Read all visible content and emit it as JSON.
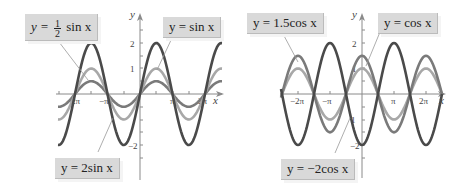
{
  "chart_data": [
    {
      "type": "line",
      "title": "",
      "xlabel": "x",
      "ylabel": "y",
      "x_ticks": [
        "-2π",
        "-π",
        "π",
        "2π"
      ],
      "y_ticks": [
        "-2",
        "1",
        "2"
      ],
      "xlim": [
        "-2.4π",
        "2.5π"
      ],
      "ylim": [
        -2.8,
        2.8
      ],
      "grid": false,
      "series": [
        {
          "name": "y = 2 sin x",
          "label": "y = 2sin x",
          "amplitude": 2,
          "func": "sin",
          "color": "#4a4a4a"
        },
        {
          "name": "y = sin x",
          "label": "y = sin x",
          "amplitude": 1,
          "func": "sin",
          "color": "#a8a8a8"
        },
        {
          "name": "y = (1/2) sin x",
          "label": "y = ½ sin x",
          "amplitude": 0.5,
          "func": "sin",
          "color": "#7a7a7a"
        }
      ],
      "annotations": [
        {
          "text_prefix": "y = ",
          "frac_num": "1",
          "frac_den": "2",
          "text_suffix": " sin x",
          "points_to": "y = (1/2) sin x"
        },
        {
          "text": "y = sin x",
          "points_to": "y = sin x"
        },
        {
          "text": "y = 2sin x",
          "points_to": "y = 2 sin x"
        }
      ]
    },
    {
      "type": "line",
      "title": "",
      "xlabel": "x",
      "ylabel": "y",
      "x_ticks": [
        "-2π",
        "-π",
        "π",
        "2π"
      ],
      "y_ticks": [
        "-2",
        "1",
        "2"
      ],
      "xlim": [
        "-2.5π",
        "2.8π"
      ],
      "ylim": [
        -2.8,
        2.8
      ],
      "grid": false,
      "series": [
        {
          "name": "y = -2 cos x",
          "label": "y = -2cos x",
          "amplitude": -2,
          "func": "cos",
          "color": "#4a4a4a"
        },
        {
          "name": "y = 1.5 cos x",
          "label": "y = 1.5cos x",
          "amplitude": 1.5,
          "func": "cos",
          "color": "#7a7a7a"
        },
        {
          "name": "y = cos x",
          "label": "y = cos x",
          "amplitude": 1,
          "func": "cos",
          "color": "#a8a8a8"
        }
      ],
      "annotations": [
        {
          "text": "y = 1.5cos x",
          "points_to": "y = 1.5 cos x"
        },
        {
          "text": "y = cos x",
          "points_to": "y = cos x"
        },
        {
          "text": "y = −2cos x",
          "points_to": "y = -2 cos x"
        }
      ]
    }
  ],
  "labels": {
    "left_half": {
      "pre": "y = ",
      "num": "1",
      "den": "2",
      "post": " sin x"
    },
    "left_sin": "y = sin x",
    "left_2sin": "y = 2sin x",
    "right_15cos": "y = 1.5cos x",
    "right_cos": "y = cos x",
    "right_m2cos": "y = −2cos x"
  },
  "axes": {
    "x": "x",
    "y": "y",
    "tick_neg2pi": "−2π",
    "tick_negpi": "−π",
    "tick_pi": "π",
    "tick_2pi": "2π",
    "tick_2": "2",
    "tick_1": "1",
    "tick_neg2": "−2"
  }
}
